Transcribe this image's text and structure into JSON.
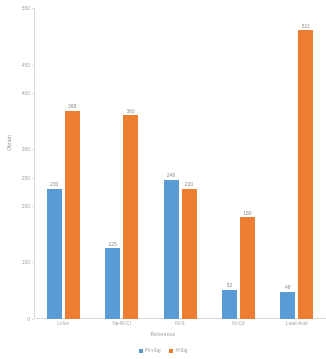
{
  "chart_data": {
    "type": "bar",
    "title": "",
    "xlabel": "Reference",
    "ylabel": "Obtain",
    "categories": [
      "Li-Ion",
      "Na-Ni-Cl",
      "Ni-S",
      "Ni-Cd",
      "Lead-Acid"
    ],
    "series": [
      {
        "name": "PV+Stg",
        "color": "#5b9bd5",
        "values": [
          230,
          125,
          246,
          52,
          48
        ],
        "labels": [
          "230",
          "125",
          "246",
          "52",
          "48"
        ]
      },
      {
        "name": "H-Stg",
        "color": "#ed7d31",
        "values": [
          368,
          360,
          230,
          180,
          511
        ],
        "labels": [
          "368",
          "360",
          "230",
          "180",
          "511"
        ]
      }
    ],
    "ylim": [
      0,
      550
    ],
    "yticks": [
      0,
      100,
      200,
      250,
      300,
      400,
      450,
      550
    ],
    "ytick_labels": [
      "0",
      "100",
      "200",
      "250",
      "300",
      "400",
      "450",
      "550"
    ],
    "grid": false,
    "legend_position": "bottom"
  },
  "axis": {
    "y_title": "Obtain",
    "x_title": "Reference"
  }
}
